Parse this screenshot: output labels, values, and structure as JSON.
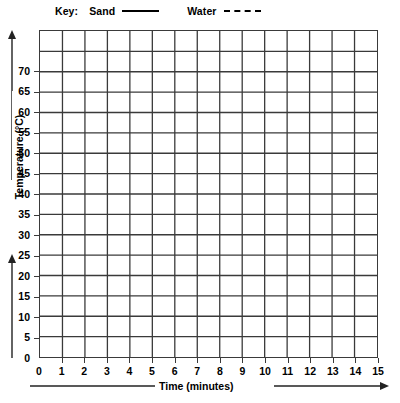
{
  "legend": {
    "key_label": "Key:",
    "entries": [
      {
        "label": "Sand",
        "style": "solid"
      },
      {
        "label": "Water",
        "style": "dashed"
      }
    ]
  },
  "axes": {
    "y_title": "Temperature (°C)",
    "x_title": "Time (minutes)",
    "y_ticks": [
      "0",
      "5",
      "10",
      "15",
      "20",
      "25",
      "30",
      "35",
      "40",
      "45",
      "50",
      "55",
      "60",
      "65",
      "70"
    ],
    "x_ticks": [
      "0",
      "1",
      "2",
      "3",
      "4",
      "5",
      "6",
      "7",
      "8",
      "9",
      "10",
      "11",
      "12",
      "13",
      "14",
      "15"
    ]
  },
  "chart_data": {
    "type": "line",
    "title": "",
    "subtitle": "",
    "xlabel": "Time (minutes)",
    "ylabel": "Temperature (°C)",
    "xlim": [
      0,
      15
    ],
    "ylim": [
      0,
      75
    ],
    "x_tick_step": 1,
    "y_tick_step": 5,
    "x_tick_labels": [
      "0",
      "1",
      "2",
      "3",
      "4",
      "5",
      "6",
      "7",
      "8",
      "9",
      "10",
      "11",
      "12",
      "13",
      "14",
      "15"
    ],
    "y_tick_labels": [
      "0",
      "5",
      "10",
      "15",
      "20",
      "25",
      "30",
      "35",
      "40",
      "45",
      "50",
      "55",
      "60",
      "65",
      "70"
    ],
    "grid": true,
    "grid_columns": 15,
    "grid_rows": 16,
    "legend": [
      "Sand",
      "Water"
    ],
    "legend_position": "top",
    "annotations": [],
    "series": [
      {
        "name": "Sand",
        "style": "solid",
        "x": [],
        "values": []
      },
      {
        "name": "Water",
        "style": "dashed",
        "x": [],
        "values": []
      }
    ],
    "note": "Blank grid template — no data plotted"
  },
  "colors": {
    "grid": "#3a3a3a",
    "ink": "#000000",
    "background": "#ffffff"
  }
}
